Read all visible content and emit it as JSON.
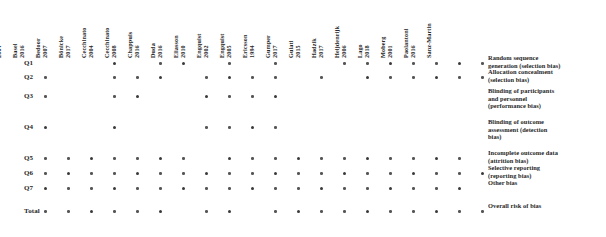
{
  "chart_data": {
    "type": "heatmap",
    "xlabel": "",
    "ylabel": "",
    "grid": false,
    "legend_position": "right",
    "categories": [
      "Åstrand 2004",
      "Basel 2016",
      "Bedoor 2007",
      "Bönicke 2017",
      "Cecchinato 2004",
      "Cecchinato 2008",
      "Chappuis 2016",
      "Duda 2016",
      "Eliasson 2010",
      "Engquist 2002",
      "Engquist 2005",
      "Ericsson 1994",
      "Gumper 2017",
      "Gulati 2015",
      "Hadzik 2017",
      "Heijdenrijk 2006",
      "Lago 2018",
      "Moberg 2001",
      "Paolantoni 2016",
      "Sanz-Martin"
    ],
    "row_labels": [
      "Q1",
      "Q2",
      "Q3",
      "Q4",
      "Q5",
      "Q6",
      "Q7",
      "Total"
    ],
    "series": [
      {
        "name": "Q1",
        "values": [
          0,
          0,
          0,
          1,
          0,
          1,
          1,
          0,
          1,
          0,
          1,
          0,
          0,
          1,
          1,
          1,
          1,
          1,
          1,
          1
        ]
      },
      {
        "name": "Q2",
        "values": [
          1,
          0,
          0,
          1,
          1,
          1,
          0,
          1,
          1,
          1,
          1,
          0,
          1,
          0,
          1,
          1,
          1,
          1,
          1,
          1
        ]
      },
      {
        "name": "Q3",
        "values": [
          1,
          0,
          0,
          1,
          1,
          0,
          0,
          1,
          1,
          1,
          1,
          0,
          0,
          0,
          0,
          0,
          0,
          0,
          0,
          0
        ]
      },
      {
        "name": "Q4",
        "values": [
          1,
          0,
          0,
          1,
          0,
          0,
          0,
          1,
          1,
          1,
          1,
          0,
          0,
          0,
          0,
          0,
          0,
          0,
          0,
          0
        ]
      },
      {
        "name": "Q5",
        "values": [
          1,
          1,
          1,
          1,
          1,
          1,
          1,
          0,
          1,
          1,
          1,
          1,
          1,
          1,
          1,
          1,
          1,
          1,
          1,
          0
        ]
      },
      {
        "name": "Q6",
        "values": [
          1,
          1,
          1,
          1,
          1,
          1,
          1,
          1,
          1,
          1,
          1,
          1,
          1,
          1,
          1,
          1,
          1,
          1,
          1,
          1
        ]
      },
      {
        "name": "Q7",
        "values": [
          1,
          1,
          1,
          1,
          1,
          1,
          1,
          1,
          1,
          1,
          1,
          1,
          1,
          1,
          1,
          1,
          1,
          1,
          1,
          0
        ]
      },
      {
        "name": "Total",
        "values": [
          1,
          1,
          1,
          1,
          1,
          1,
          0,
          1,
          1,
          0,
          1,
          1,
          1,
          1,
          1,
          1,
          1,
          1,
          1,
          1
        ]
      }
    ],
    "legend_entries": [
      {
        "key": "Q1",
        "lines": [
          "Random sequence",
          "generation (selection bias)"
        ]
      },
      {
        "key": "Q2",
        "lines": [
          "Allocation concealment",
          "(selection bias)"
        ]
      },
      {
        "key": "Q3",
        "lines": [
          "Blinding of participants",
          "and personnel",
          "(performance bias)"
        ]
      },
      {
        "key": "Q4",
        "lines": [
          "Blinding of outcome",
          "assessment (detection",
          "bias)"
        ]
      },
      {
        "key": "Q5",
        "lines": [
          "Incomplete outcome data",
          "(attrition bias)"
        ]
      },
      {
        "key": "Q6",
        "lines": [
          "Selective reporting",
          "(reporting bias)"
        ]
      },
      {
        "key": "Q7",
        "lines": [
          "Other bias"
        ]
      },
      {
        "key": "Total",
        "lines": [
          "Overall risk of bias"
        ]
      }
    ],
    "colors": {
      "dot": "#555555",
      "dot_strong": "#3a3a3a",
      "text": "#262626",
      "background": "#ffffff"
    }
  }
}
